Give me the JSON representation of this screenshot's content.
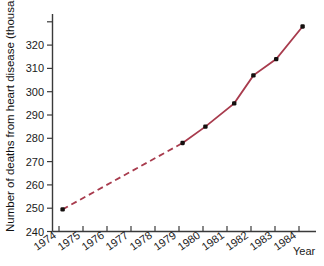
{
  "chart_data": {
    "type": "line",
    "title": "",
    "xlabel": "Year",
    "ylabel": "Number of deaths from heart disease (thousands)",
    "xlim": [
      1974,
      1984.6
    ],
    "ylim": [
      240,
      332
    ],
    "grid": false,
    "legend": "none",
    "x_tick_labels": [
      "1974",
      "1975",
      "1976",
      "1977",
      "1978",
      "1979",
      "1980",
      "1981",
      "1982",
      "1983",
      "1984"
    ],
    "y_tick_labels": [
      "240",
      "250",
      "260",
      "270",
      "280",
      "290",
      "300",
      "310",
      "320"
    ],
    "y_ticks": [
      240,
      250,
      260,
      270,
      280,
      290,
      300,
      310,
      320
    ],
    "series": [
      {
        "name": "Deaths from heart disease",
        "color": "#a83b4d",
        "marker_color": "#15100f",
        "segments": [
          {
            "style": "dashed",
            "points": [
              {
                "x": 1974.15,
                "y": 249.5
              },
              {
                "x": 1979.15,
                "y": 278.0
              }
            ]
          },
          {
            "style": "solid",
            "points": [
              {
                "x": 1979.15,
                "y": 278.0
              },
              {
                "x": 1980.1,
                "y": 285.0
              },
              {
                "x": 1981.3,
                "y": 295.0
              },
              {
                "x": 1982.1,
                "y": 307.0
              },
              {
                "x": 1983.05,
                "y": 314.0
              },
              {
                "x": 1984.15,
                "y": 328.0
              }
            ]
          }
        ],
        "points": [
          {
            "x": 1974.15,
            "y": 249.5
          },
          {
            "x": 1979.15,
            "y": 278.0
          },
          {
            "x": 1980.1,
            "y": 285.0
          },
          {
            "x": 1981.3,
            "y": 295.0
          },
          {
            "x": 1982.1,
            "y": 307.0
          },
          {
            "x": 1983.05,
            "y": 314.0
          },
          {
            "x": 1984.15,
            "y": 328.0
          }
        ]
      }
    ]
  }
}
